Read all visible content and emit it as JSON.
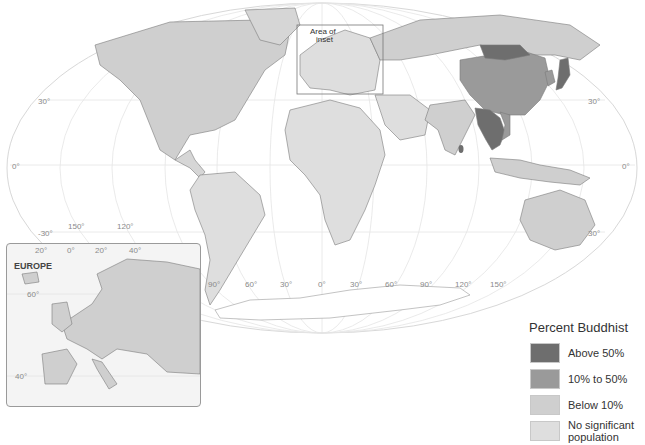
{
  "map": {
    "title": "Percent Buddhist",
    "projection": "Mollweide world",
    "inset_box_label": "Area of inset",
    "latitude_labels": {
      "left": [
        "30°",
        "0°",
        "-30°"
      ],
      "right": [
        "30°",
        "0°",
        "30°"
      ]
    },
    "longitude_labels": [
      "150°",
      "120°",
      "90°",
      "60°",
      "30°",
      "0°",
      "30°",
      "60°",
      "90°",
      "120°",
      "150°"
    ],
    "colors": {
      "above_50": "#6e6e6e",
      "pct_10_50": "#9a9a9a",
      "below_10": "#cfcfcf",
      "no_significant": "#dedede",
      "ocean": "#ffffff",
      "border": "#7a7a7a",
      "graticule": "#e2e2e2"
    },
    "regions": {
      "above_50": [
        "Myanmar",
        "Thailand",
        "Laos",
        "Cambodia",
        "Sri Lanka",
        "Japan",
        "Bhutan",
        "Mongolia"
      ],
      "pct_10_50": [
        "China",
        "South Korea",
        "Vietnam"
      ],
      "below_10": [
        "India",
        "Nepal",
        "Malaysia",
        "Indonesia",
        "Russia",
        "Australia",
        "United States",
        "Canada"
      ],
      "no_significant": [
        "Africa",
        "South America",
        "Middle East",
        "Europe"
      ]
    }
  },
  "legend": {
    "title": "Percent Buddhist",
    "items": [
      {
        "label": "Above 50%",
        "color": "#6e6e6e"
      },
      {
        "label": "10% to 50%",
        "color": "#9a9a9a"
      },
      {
        "label": "Below 10%",
        "color": "#cfcfcf"
      },
      {
        "label": "No significant population",
        "color": "#dedede"
      }
    ]
  },
  "inset": {
    "title": "EUROPE",
    "top_ticks": [
      "20°",
      "0°",
      "20°",
      "40°"
    ],
    "side_ticks": [
      "60°",
      "40°"
    ]
  }
}
